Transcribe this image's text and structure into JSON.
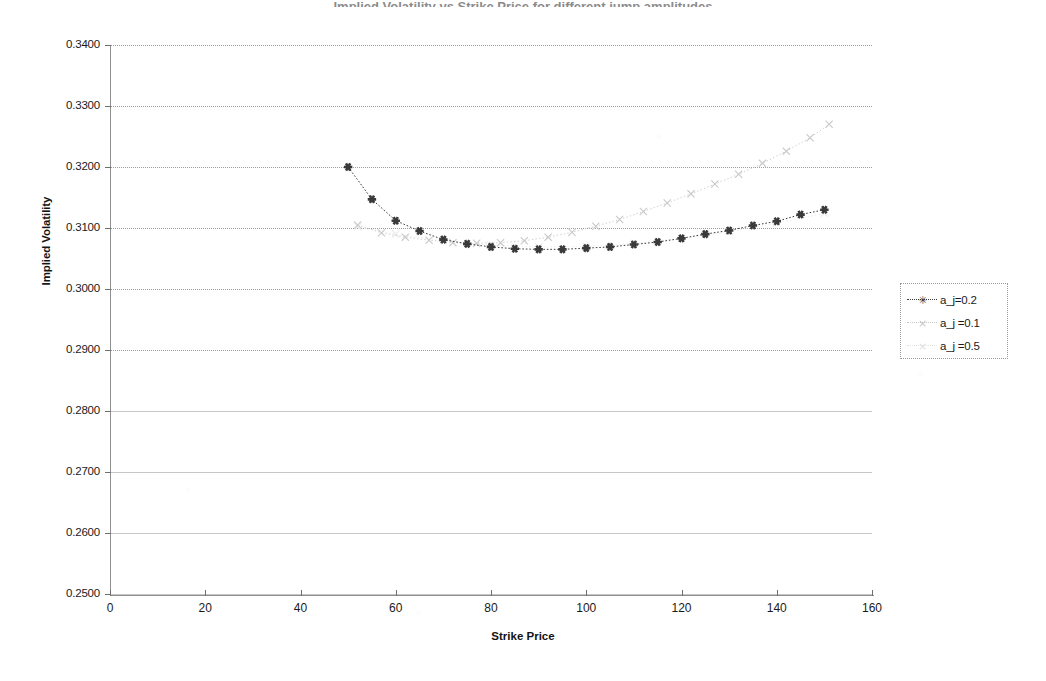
{
  "chart_title": "Implied Volatility vs Strike Price for different jump amplitudes",
  "axes": {
    "ylabel": "Implied Volatility",
    "xlabel": "Strike Price",
    "y_ticks": [
      "0.2500",
      "0.2600",
      "0.2700",
      "0.2800",
      "0.2900",
      "0.3000",
      "0.3100",
      "0.3200",
      "0.3300",
      "0.3400"
    ],
    "x_ticks": [
      "0",
      "20",
      "40",
      "60",
      "80",
      "100",
      "120",
      "140",
      "160"
    ]
  },
  "legend": {
    "items": [
      {
        "label": "a_j=0.2",
        "marker": "asterisk-marker",
        "color": "#3a3a3a"
      },
      {
        "label": "a_j =0.1",
        "marker": "cross-marker",
        "color": "#c9c9c9"
      },
      {
        "label": "a_j =0.5",
        "marker": "cross-marker",
        "color": "#e2e2e2"
      }
    ]
  },
  "chart_data": {
    "type": "line",
    "title": "Implied Volatility vs Strike Price for different jump amplitudes",
    "xlabel": "Strike Price",
    "ylabel": "Implied Volatility",
    "xlim": [
      0,
      160
    ],
    "ylim": [
      0.25,
      0.34
    ],
    "ytick_step": 0.01,
    "xtick_step": 20,
    "grid": "horizontal-dotted",
    "legend_position": "right",
    "series": [
      {
        "name": "a_j=0.2",
        "color": "#3a3a3a",
        "marker": "asterisk-marker",
        "x": [
          50,
          55,
          60,
          65,
          70,
          75,
          80,
          85,
          90,
          95,
          100,
          105,
          110,
          115,
          120,
          125,
          130,
          135,
          140,
          145,
          150
        ],
        "y": [
          0.32,
          0.3147,
          0.3112,
          0.3095,
          0.3081,
          0.3074,
          0.3069,
          0.3066,
          0.3065,
          0.3065,
          0.3067,
          0.3069,
          0.3073,
          0.3077,
          0.3083,
          0.309,
          0.3096,
          0.3104,
          0.3111,
          0.3122,
          0.313
        ]
      },
      {
        "name": "a_j =0.1",
        "color": "#c9c9c9",
        "marker": "cross-marker",
        "x": [
          52,
          57,
          62,
          67,
          72,
          77,
          82,
          87,
          92,
          97,
          102,
          107,
          112,
          117,
          122,
          127,
          132,
          137,
          142,
          147,
          151
        ],
        "y": [
          0.3105,
          0.3092,
          0.3085,
          0.308,
          0.3076,
          0.3075,
          0.3076,
          0.3079,
          0.3085,
          0.3093,
          0.3103,
          0.3114,
          0.3127,
          0.3141,
          0.3156,
          0.3172,
          0.3188,
          0.3206,
          0.3226,
          0.3248,
          0.327
        ]
      },
      {
        "name": "a_j =0.5",
        "color": "#ececec",
        "marker": "cross-marker",
        "x": [
          52,
          60,
          70,
          80,
          90,
          100,
          110,
          120,
          130,
          140,
          150
        ],
        "y": [
          0.3102,
          0.309,
          0.3079,
          0.3072,
          0.3069,
          0.307,
          0.3075,
          0.3083,
          0.3094,
          0.3108,
          0.3124
        ]
      }
    ]
  }
}
